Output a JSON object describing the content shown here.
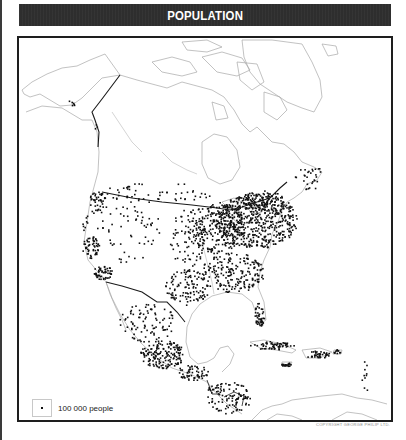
{
  "title": "POPULATION",
  "legend": {
    "symbol": "dot",
    "label": "100 000 people"
  },
  "copyright": "COPYRIGHT GEORGE PHILIP LTD.",
  "colors": {
    "banner": "#2e2e2e",
    "frame": "#1e1e1e",
    "coast": "#a8a8a8",
    "border": "#1a1a1a",
    "dots": "#111111"
  },
  "map": {
    "region": "North America and Central America",
    "dot_value": "100 000 people",
    "clusters": [
      {
        "name": "northeast-us",
        "cx": 255,
        "cy": 218,
        "rx": 40,
        "ry": 28,
        "n": 520
      },
      {
        "name": "midwest-us",
        "cx": 215,
        "cy": 225,
        "rx": 28,
        "ry": 26,
        "n": 260
      },
      {
        "name": "southeast-us",
        "cx": 230,
        "cy": 270,
        "rx": 32,
        "ry": 20,
        "n": 200
      },
      {
        "name": "texas",
        "cx": 185,
        "cy": 285,
        "rx": 22,
        "ry": 18,
        "n": 110
      },
      {
        "name": "plains",
        "cx": 185,
        "cy": 235,
        "rx": 18,
        "ry": 30,
        "n": 80
      },
      {
        "name": "west-interior",
        "cx": 120,
        "cy": 225,
        "rx": 40,
        "ry": 35,
        "n": 80
      },
      {
        "name": "california-north",
        "cx": 88,
        "cy": 245,
        "rx": 8,
        "ry": 12,
        "n": 50
      },
      {
        "name": "california-south",
        "cx": 100,
        "cy": 270,
        "rx": 10,
        "ry": 7,
        "n": 55
      },
      {
        "name": "pacific-nw",
        "cx": 95,
        "cy": 198,
        "rx": 8,
        "ry": 10,
        "n": 40
      },
      {
        "name": "canada-south",
        "cx": 160,
        "cy": 190,
        "rx": 60,
        "ry": 10,
        "n": 50
      },
      {
        "name": "quebec-ontario",
        "cx": 262,
        "cy": 198,
        "rx": 20,
        "ry": 10,
        "n": 90
      },
      {
        "name": "maritimes",
        "cx": 307,
        "cy": 175,
        "rx": 15,
        "ry": 12,
        "n": 30
      },
      {
        "name": "florida",
        "cx": 257,
        "cy": 312,
        "rx": 5,
        "ry": 12,
        "n": 45
      },
      {
        "name": "mexico-north",
        "cx": 145,
        "cy": 320,
        "rx": 28,
        "ry": 20,
        "n": 90
      },
      {
        "name": "mexico-central",
        "cx": 160,
        "cy": 352,
        "rx": 22,
        "ry": 14,
        "n": 170
      },
      {
        "name": "mexico-south",
        "cx": 190,
        "cy": 370,
        "rx": 16,
        "ry": 8,
        "n": 60
      },
      {
        "name": "central-america",
        "cx": 225,
        "cy": 395,
        "rx": 24,
        "ry": 16,
        "n": 110
      },
      {
        "name": "cuba",
        "cx": 270,
        "cy": 343,
        "rx": 22,
        "ry": 4,
        "n": 60
      },
      {
        "name": "hispaniola",
        "cx": 315,
        "cy": 352,
        "rx": 12,
        "ry": 4,
        "n": 40
      },
      {
        "name": "jamaica",
        "cx": 284,
        "cy": 362,
        "rx": 6,
        "ry": 2,
        "n": 20
      },
      {
        "name": "puerto-rico",
        "cx": 335,
        "cy": 349,
        "rx": 4,
        "ry": 2,
        "n": 12
      },
      {
        "name": "lesser-antilles",
        "cx": 362,
        "cy": 375,
        "rx": 4,
        "ry": 18,
        "n": 10
      },
      {
        "name": "alaska",
        "cx": 70,
        "cy": 100,
        "rx": 5,
        "ry": 3,
        "n": 6
      },
      {
        "name": "bc-coast",
        "cx": 93,
        "cy": 125,
        "rx": 2,
        "ry": 4,
        "n": 3
      }
    ]
  }
}
